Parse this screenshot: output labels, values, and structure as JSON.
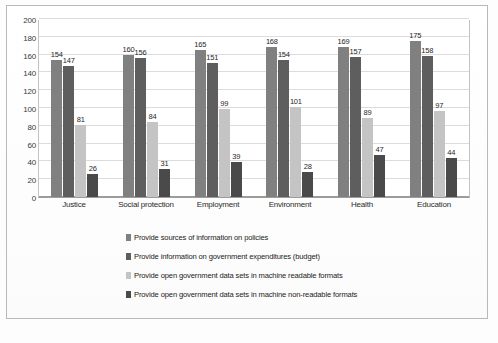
{
  "chart_data": {
    "type": "bar",
    "title": "",
    "subtitle": "",
    "xlabel": "",
    "ylabel": "",
    "ylim": [
      0,
      200
    ],
    "ytick_step": 20,
    "yticks": [
      200,
      180,
      160,
      140,
      120,
      100,
      80,
      60,
      40,
      20,
      0
    ],
    "grid": true,
    "legend_position": "bottom",
    "categories": [
      "Justice",
      "Social protection",
      "Employment",
      "Environment",
      "Health",
      "Education"
    ],
    "series": [
      {
        "name": "Provide sources of information on policies",
        "color": "#808080",
        "values": [
          154,
          160,
          165,
          168,
          169,
          175
        ]
      },
      {
        "name": "Provide information on government expenditures (budget)",
        "color": "#5e5e5e",
        "values": [
          147,
          156,
          151,
          154,
          157,
          158
        ]
      },
      {
        "name": "Provide open government data sets in machine readable formats",
        "color": "#c4c4c4",
        "values": [
          81,
          84,
          99,
          101,
          89,
          97
        ]
      },
      {
        "name": "Provide open government data sets in machine non-readable formats",
        "color": "#4a4a4a",
        "values": [
          26,
          31,
          39,
          28,
          47,
          44
        ]
      }
    ]
  },
  "colors": {
    "series_1": "#808080",
    "series_2": "#5e5e5e",
    "series_3": "#c4c4c4",
    "series_4": "#4a4a4a",
    "gridline": "#dcdcdc",
    "axis": "#9c9c9c",
    "frame": "#b9b9b9",
    "background": "#ffffff"
  }
}
